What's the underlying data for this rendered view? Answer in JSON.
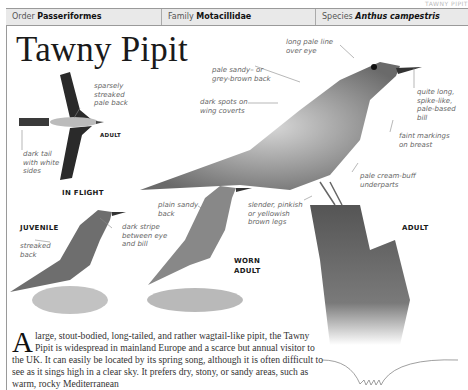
{
  "page_header": "TAWNY PIPIT",
  "taxonomy": {
    "order_label": "Order",
    "order_value": "Passeriformes",
    "family_label": "Family",
    "family_value": "Motacillidae",
    "species_label": "Species",
    "species_value": "Anthus campestris"
  },
  "title": "Tawny Pipit",
  "illustrations": {
    "in_flight": {
      "caption": "IN FLIGHT",
      "tag": "ADULT",
      "annotations": [
        "sparsely streaked pale back",
        "dark tail with white sides"
      ]
    },
    "adult": {
      "tag": "ADULT",
      "annotations": [
        "long pale line over eye",
        "pale sandy– or grey-brown back",
        "dark spots on wing coverts",
        "quite long, spike-like, pale-based bill",
        "faint markings on breast",
        "pale cream-buff underparts",
        "slender, pinkish or yellowish brown legs"
      ]
    },
    "juvenile": {
      "tag": "JUVENILE",
      "annotations": [
        "streaked back",
        "dark stripe between eye and bill"
      ]
    },
    "worn_adult": {
      "tag": "WORN ADULT",
      "annotations": [
        "plain sandy back"
      ]
    }
  },
  "body": {
    "dropcap": "A",
    "text": " large, stout-bodied, long-tailed, and rather wagtail-like pipit, the Tawny Pipit is widespread in mainland Europe and a scarce but annual visitor to the UK. It can easily be located by its spring song, although it is often difficult to see as it sings high in a clear sky. It prefers dry, stony, or sandy areas, such as warm, rocky Mediterranean"
  }
}
